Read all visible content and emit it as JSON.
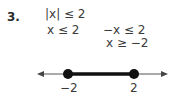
{
  "problem": {
    "number": "3.",
    "original": "|x| ≤ 2",
    "case1": "x ≤ 2",
    "case2_step1": "−x ≤ 2",
    "case2_step2": "x ≥ −2"
  },
  "number_line": {
    "left_label": "−2",
    "right_label": "2",
    "left_endpoint": "closed",
    "right_endpoint": "closed",
    "segment_color": "#111111"
  }
}
